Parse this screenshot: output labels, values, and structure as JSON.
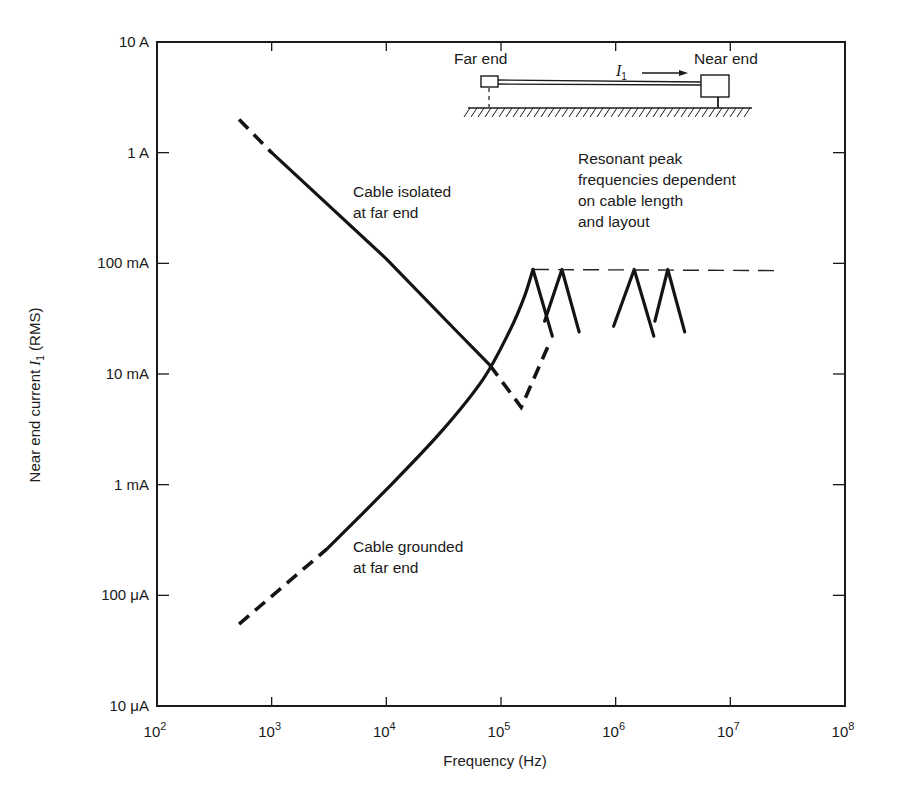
{
  "chart_data": {
    "type": "line",
    "title": "",
    "xlabel": "Frequency (Hz)",
    "ylabel_parts": [
      "Near end current ",
      "I",
      "1",
      " (RMS)"
    ],
    "xscale": "log",
    "yscale": "log",
    "xlim": [
      100,
      100000000
    ],
    "ylim": [
      1e-05,
      10
    ],
    "x_ticks": [
      {
        "value": 100,
        "base": "10",
        "exp": "2"
      },
      {
        "value": 1000,
        "base": "10",
        "exp": "3"
      },
      {
        "value": 10000,
        "base": "10",
        "exp": "4"
      },
      {
        "value": 100000,
        "base": "10",
        "exp": "5"
      },
      {
        "value": 1000000,
        "base": "10",
        "exp": "6"
      },
      {
        "value": 10000000,
        "base": "10",
        "exp": "7"
      },
      {
        "value": 100000000,
        "base": "10",
        "exp": "8"
      }
    ],
    "y_ticks": [
      {
        "value": 10,
        "label": "10 A"
      },
      {
        "value": 1,
        "label": "1 A"
      },
      {
        "value": 0.1,
        "label": "100 mA"
      },
      {
        "value": 0.01,
        "label": "10 mA"
      },
      {
        "value": 0.001,
        "label": "1 mA"
      },
      {
        "value": 0.0001,
        "label": "100 μA"
      },
      {
        "value": 1e-05,
        "label": "10 μA"
      }
    ],
    "grid": false,
    "series": [
      {
        "name": "Cable isolated at far end",
        "segments": [
          {
            "style": "dashed",
            "points": [
              [
                520,
                2.0
              ],
              [
                1000,
                1.0
              ]
            ]
          },
          {
            "style": "solid",
            "points": [
              [
                1000,
                1.0
              ],
              [
                10000,
                0.11
              ],
              [
                40000,
                0.025
              ],
              [
                80000,
                0.012
              ]
            ]
          },
          {
            "style": "dashed",
            "points": [
              [
                80000,
                0.012
              ],
              [
                150000,
                0.005
              ],
              [
                270000,
                0.02
              ]
            ]
          }
        ]
      },
      {
        "name": "Cable grounded at far end",
        "segments": [
          {
            "style": "dashed",
            "points": [
              [
                520,
                5.5e-05
              ],
              [
                3000,
                0.00026
              ]
            ]
          },
          {
            "style": "solid",
            "points": [
              [
                3000,
                0.00026
              ],
              [
                10000,
                0.0009
              ],
              [
                30000,
                0.003
              ],
              [
                70000,
                0.009
              ],
              [
                120000,
                0.025
              ],
              [
                160000,
                0.05
              ],
              [
                190000,
                0.088
              ]
            ]
          }
        ]
      },
      {
        "name": "Resonant peaks",
        "segments": [
          {
            "style": "solid",
            "points": [
              [
                190000,
                0.088
              ],
              [
                280000,
                0.022
              ]
            ]
          },
          {
            "style": "solid",
            "points": [
              [
                240000,
                0.03
              ],
              [
                340000,
                0.088
              ],
              [
                480000,
                0.024
              ]
            ]
          },
          {
            "style": "solid",
            "points": [
              [
                960000,
                0.027
              ],
              [
                1450000,
                0.088
              ],
              [
                2150000,
                0.022
              ]
            ]
          },
          {
            "style": "solid",
            "points": [
              [
                2200000,
                0.03
              ],
              [
                2850000,
                0.088
              ],
              [
                4000000,
                0.024
              ]
            ]
          }
        ]
      },
      {
        "name": "Peak envelope",
        "segments": [
          {
            "style": "thin-dashed",
            "points": [
              [
                190000,
                0.088
              ],
              [
                25000000,
                0.086
              ]
            ]
          }
        ]
      }
    ],
    "annotations": [
      {
        "id": "isolated",
        "lines": [
          "Cable isolated",
          "at far end"
        ]
      },
      {
        "id": "grounded",
        "lines": [
          "Cable grounded",
          "at far end"
        ]
      },
      {
        "id": "resonant",
        "lines": [
          "Resonant peak",
          "frequencies dependent",
          "on cable length",
          "and layout"
        ]
      }
    ],
    "inset": {
      "far_end_label": "Far end",
      "near_end_label": "Near end",
      "current_symbol": "I",
      "current_subscript": "1"
    }
  }
}
